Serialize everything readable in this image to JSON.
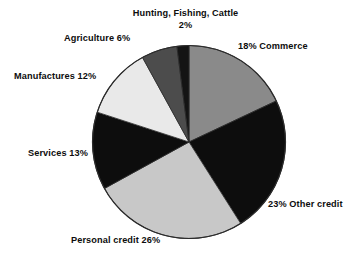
{
  "chart_data": {
    "type": "pie",
    "title": "",
    "subtitle": "",
    "xlabel": "",
    "ylabel": "",
    "legend_position": "none",
    "grid": false,
    "units": "percent",
    "start_angle_deg": 0,
    "direction": "clockwise",
    "categories": [
      "Commerce",
      "Other credit",
      "Personal credit",
      "Services",
      "Manufactures",
      "Agriculture",
      "Hunting, Fishing, Cattle"
    ],
    "values": [
      18,
      23,
      26,
      13,
      12,
      6,
      2
    ],
    "slices": [
      {
        "name": "Commerce",
        "value": 18,
        "label": "18% Commerce",
        "label_text": "Commerce",
        "label_percent": "18%",
        "color": "#8a8a8a"
      },
      {
        "name": "Other credit",
        "value": 23,
        "label": "23% Other credit",
        "label_text": "Other credit",
        "label_percent": "23%",
        "color": "#0d0d0d"
      },
      {
        "name": "Personal credit",
        "value": 26,
        "label": "Personal credit 26%",
        "label_text": "Personal credit",
        "label_percent": "26%",
        "color": "#c8c8c8"
      },
      {
        "name": "Services",
        "value": 13,
        "label": "Services 13%",
        "label_text": "Services",
        "label_percent": "13%",
        "color": "#0d0d0d"
      },
      {
        "name": "Manufactures",
        "value": 12,
        "label": "Manufactures 12%",
        "label_text": "Manufactures",
        "label_percent": "12%",
        "color": "#e9e9e9"
      },
      {
        "name": "Agriculture",
        "value": 6,
        "label": "Agriculture 6%",
        "label_text": "Agriculture",
        "label_percent": "6%",
        "color": "#4c4c4c"
      },
      {
        "name": "Hunting, Fishing, Cattle",
        "value": 2,
        "label": "Hunting, Fishing, Cattle 2%",
        "label_text": "Hunting, Fishing, Cattle",
        "label_percent": "2%",
        "color": "#141414"
      }
    ]
  },
  "labels": {
    "hunting_line1": "Hunting, Fishing, Cattle",
    "hunting_line2": "2%",
    "agriculture": "Agriculture 6%",
    "manufactures": "Manufactures 12%",
    "services": "Services 13%",
    "personal_credit": "Personal credit 26%",
    "other_credit": "23% Other credit",
    "commerce": "18% Commerce"
  },
  "colors": {
    "background": "#ffffff",
    "text": "#0d0d0d",
    "outline": "#2b2b2b"
  }
}
